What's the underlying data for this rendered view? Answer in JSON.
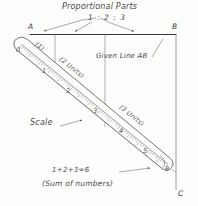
{
  "figure": {
    "title": "Proportional Parts",
    "ratio": "1 : 2 : 3",
    "given_line_label": "Given Line AB",
    "scale_label": "Scale",
    "sum_equation": "1+2+3=6",
    "sum_caption": "(Sum of numbers)",
    "ink_color": "#4a4a48",
    "paper_color": "#fdfdfc"
  },
  "points": {
    "a": "A",
    "b": "B",
    "c": "C"
  },
  "segments": [
    {
      "label": "(1)",
      "units": 1
    },
    {
      "label": "(2 Units)",
      "units": 2
    },
    {
      "label": "(3 Units)",
      "units": 3
    }
  ],
  "scale": {
    "zero_label": "0",
    "tick_numbers": [
      "1",
      "2",
      "3",
      "4",
      "5",
      "6"
    ],
    "end_number": "6"
  }
}
